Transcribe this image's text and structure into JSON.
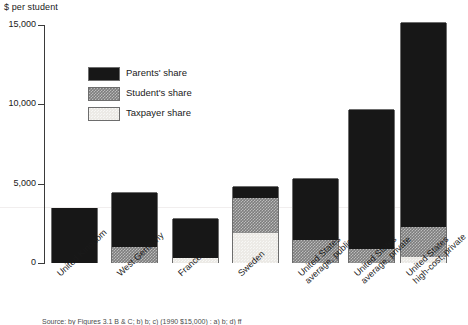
{
  "chart_data": {
    "type": "bar",
    "stacked": true,
    "title": "",
    "ylabel": "$ per student",
    "xlabel": "",
    "ylim": [
      0,
      15000
    ],
    "yticks": [
      0,
      5000,
      10000,
      15000
    ],
    "ytick_labels": [
      "0",
      "5,000",
      "10,000",
      "15,000"
    ],
    "grid": false,
    "legend_position": "upper-left-inside",
    "categories": [
      "United Kingdom",
      "West Germany",
      "France",
      "Sweden",
      "United States average, public",
      "United States average, private",
      "United States high-cost, private"
    ],
    "series": [
      {
        "name": "Parents' share",
        "values": [
          3480,
          3420,
          2470,
          700,
          3850,
          8740,
          12880
        ]
      },
      {
        "name": "Student's share",
        "values": [
          0,
          1010,
          0,
          2210,
          1470,
          880,
          1880
        ]
      },
      {
        "name": "Taxpayer share",
        "values": [
          0,
          0,
          320,
          1900,
          0,
          0,
          380
        ]
      }
    ],
    "totals": [
      3480,
      4430,
      2790,
      4810,
      5320,
      9620,
      15140
    ]
  },
  "axis": {
    "y_title": "$ per student",
    "ticks": [
      {
        "label": "15,000",
        "value": 15000
      },
      {
        "label": "10,000",
        "value": 10000
      },
      {
        "label": "5,000",
        "value": 5000
      },
      {
        "label": "0",
        "value": 0
      }
    ]
  },
  "legend": {
    "items": [
      {
        "label": "Parents' share",
        "swatch": "parents",
        "color": "#171717"
      },
      {
        "label": "Student's share",
        "swatch": "student",
        "color": "#7d7d7d"
      },
      {
        "label": "Taxpayer share",
        "swatch": "taxpayer",
        "color": "#eceae6"
      }
    ]
  },
  "categories": [
    {
      "line1": "United Kingdom",
      "line2": ""
    },
    {
      "line1": "West Germany",
      "line2": ""
    },
    {
      "line1": "France",
      "line2": ""
    },
    {
      "line1": "Sweden",
      "line2": ""
    },
    {
      "line1": "United States",
      "line2": "average, public"
    },
    {
      "line1": "United States",
      "line2": "average, private"
    },
    {
      "line1": "United States",
      "line2": "high-cost, private"
    }
  ],
  "source": "Source: by Figures 3.1 B & C; b) b; c)  (1990     $15,000) : a) b; d) ff"
}
